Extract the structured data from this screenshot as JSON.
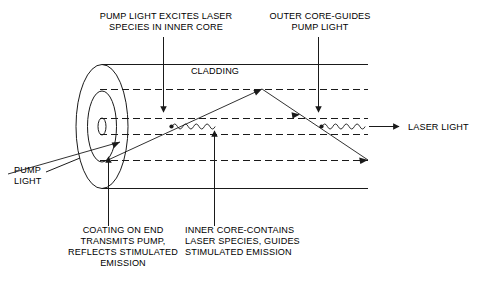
{
  "figure": {
    "title_alt": "Double-clad fiber laser schematic",
    "stroke_color": "#1a1a1a",
    "background": "#ffffff"
  },
  "labels": {
    "pump_excites": {
      "lines": [
        "PUMP LIGHT EXCITES LASER",
        "SPECIES IN INNER CORE"
      ],
      "anchor_x": 166,
      "line_y": [
        19,
        30
      ]
    },
    "outer_core": {
      "lines": [
        "OUTER CORE-GUIDES",
        "PUMP LIGHT"
      ],
      "anchor_x": 320,
      "line_y": [
        19,
        30
      ]
    },
    "cladding": {
      "lines": [
        "CLADDING"
      ],
      "anchor_x": 215,
      "line_y": [
        74
      ]
    },
    "pump_light": {
      "lines": [
        "PUMP",
        "LIGHT"
      ],
      "anchor_x": 14,
      "line_y": [
        173,
        184
      ]
    },
    "laser_light": {
      "lines": [
        "LASER LIGHT"
      ],
      "anchor_x": 408,
      "line_y": [
        129
      ]
    },
    "coating": {
      "lines": [
        "COATING ON END",
        "TRANSMITS PUMP,",
        "REFLECTS STIMULATED",
        "EMISSION"
      ],
      "anchor_x": 123,
      "line_y": [
        233,
        244,
        255,
        266
      ]
    },
    "inner_core": {
      "lines": [
        "INNER CORE-CONTAINS",
        "LASER SPECIES, GUIDES",
        "STIMULATED EMISSION"
      ],
      "anchor_x": 244,
      "line_y": [
        233,
        244,
        255
      ]
    }
  }
}
